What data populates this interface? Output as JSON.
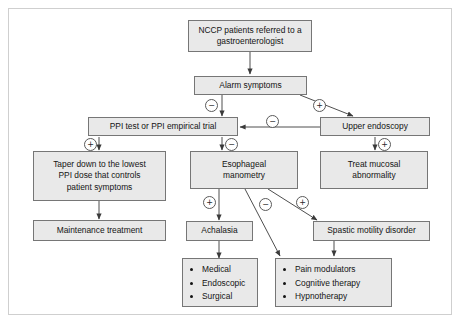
{
  "diagram": {
    "colors": {
      "node_fill": "#e9e9e9",
      "node_border": "#767676",
      "frame_border": "#cfcfcf",
      "text": "#141414",
      "edge": "#3a3a3a"
    },
    "nodes": [
      {
        "id": "nccp",
        "lines": [
          "NCCP patients referred to a",
          "gastroenterologist"
        ]
      },
      {
        "id": "alarm",
        "lines": [
          "Alarm symptoms"
        ]
      },
      {
        "id": "ppi",
        "lines": [
          "PPI test or PPI empirical trial"
        ]
      },
      {
        "id": "endoscopy",
        "lines": [
          "Upper endoscopy"
        ]
      },
      {
        "id": "taper",
        "lines": [
          "Taper down to the lowest",
          "PPI dose that controls",
          "patient symptoms"
        ]
      },
      {
        "id": "manometry",
        "lines": [
          "Esophageal",
          "manometry"
        ]
      },
      {
        "id": "mucosal",
        "lines": [
          "Treat mucosal",
          "abnormality"
        ]
      },
      {
        "id": "maintenance",
        "lines": [
          "Maintenance treatment"
        ]
      },
      {
        "id": "achalasia",
        "lines": [
          "Achalasia"
        ]
      },
      {
        "id": "spastic",
        "lines": [
          "Spastic motility disorder"
        ]
      }
    ],
    "lists": {
      "achalasia_tx": [
        "Medical",
        "Endoscopic",
        "Surgical"
      ],
      "spastic_tx": [
        "Pain modulators",
        "Cognitive therapy",
        "Hypnotherapy"
      ]
    },
    "signs": {
      "alarm_negative": "−",
      "alarm_positive": "+",
      "endoscopy_negative": "−",
      "ppi_positive": "+",
      "ppi_negative": "−",
      "endoscopy_positive": "+",
      "manometry_positive": "+",
      "manometry_negative": "−",
      "manometry_spastic_positive": "+"
    }
  }
}
